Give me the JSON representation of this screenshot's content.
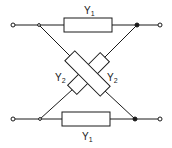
{
  "diagram": {
    "type": "lattice-network",
    "colors": {
      "line": "#1a1a1a",
      "background": "#ffffff"
    },
    "elements": {
      "top_series": {
        "label": "Y",
        "subscript": "1"
      },
      "bottom_series": {
        "label": "Y",
        "subscript": "1"
      },
      "cross_left": {
        "label": "Y",
        "subscript": "2"
      },
      "cross_right": {
        "label": "Y",
        "subscript": "2"
      }
    },
    "terminals": [
      "top-left",
      "top-right",
      "bottom-left",
      "bottom-right"
    ]
  }
}
